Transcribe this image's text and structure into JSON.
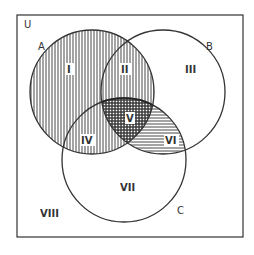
{
  "diagram": {
    "type": "venn",
    "universe_label": "U",
    "sets": [
      {
        "label": "A",
        "cx": 92,
        "cy": 92,
        "r": 62
      },
      {
        "label": "B",
        "cx": 163,
        "cy": 92,
        "r": 62
      },
      {
        "label": "C",
        "cx": 124,
        "cy": 160,
        "r": 62
      }
    ],
    "regions": [
      {
        "id": "I",
        "label": "I",
        "description": "A only",
        "pattern": "vertical"
      },
      {
        "id": "II",
        "label": "II",
        "description": "A and B, not C",
        "pattern": "vertical"
      },
      {
        "id": "III",
        "label": "III",
        "description": "B only",
        "pattern": "none"
      },
      {
        "id": "IV",
        "label": "IV",
        "description": "A and C, not B",
        "pattern": "vertical"
      },
      {
        "id": "V",
        "label": "V",
        "description": "A, B and C",
        "pattern": "crosshatch"
      },
      {
        "id": "VI",
        "label": "VI",
        "description": "B and C, not A",
        "pattern": "horizontal"
      },
      {
        "id": "VII",
        "label": "VII",
        "description": "C only",
        "pattern": "none"
      },
      {
        "id": "VIII",
        "label": "VIII",
        "description": "outside A, B and C",
        "pattern": "none"
      }
    ],
    "colors": {
      "line": "#333333",
      "background": "#ffffff"
    }
  }
}
